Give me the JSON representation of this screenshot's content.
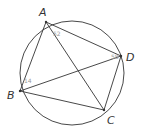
{
  "diagram": {
    "type": "cyclic-quadrilateral",
    "circle": {
      "cx": 72,
      "cy": 73,
      "r": 52
    },
    "vertices": {
      "A": {
        "label": "A",
        "x": 46,
        "y": 22
      },
      "B": {
        "label": "B",
        "x": 20,
        "y": 91
      },
      "C": {
        "label": "C",
        "x": 104,
        "y": 110
      },
      "D": {
        "label": "D",
        "x": 121,
        "y": 56
      }
    },
    "segments": [
      "AB",
      "BC",
      "CD",
      "DA",
      "AC",
      "BD"
    ],
    "angle_labels": {
      "A": "52",
      "D": "58",
      "B": "14"
    },
    "colors": {
      "stroke": "#333333",
      "label": "#333333",
      "angle": "#9a9a9a"
    }
  }
}
